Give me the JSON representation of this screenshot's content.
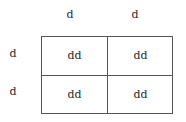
{
  "punnett_square": {
    "column_alleles": [
      "d",
      "d"
    ],
    "row_alleles": [
      "d",
      "d"
    ],
    "cells": [
      [
        "dd",
        "dd"
      ],
      [
        "dd",
        "dd"
      ]
    ]
  }
}
